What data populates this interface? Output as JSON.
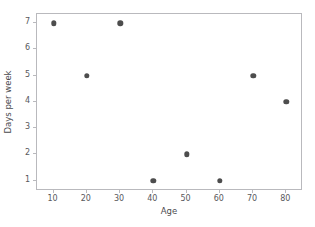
{
  "chart_data": {
    "type": "scatter",
    "title": "",
    "xlabel": "Age",
    "ylabel": "Days per week",
    "xlim": [
      5,
      85
    ],
    "ylim": [
      0.6,
      7.35
    ],
    "grid": false,
    "legend": null,
    "marker_color": "#4d4d4d",
    "frame_color": "#b9b9bd",
    "background_color": "#ffffff",
    "xticks": [
      10,
      20,
      30,
      40,
      50,
      60,
      70,
      80
    ],
    "xtick_labels": [
      "10",
      "20",
      "30",
      "40",
      "50",
      "60",
      "70",
      "80"
    ],
    "yticks": [
      1,
      2,
      3,
      4,
      5,
      6,
      7
    ],
    "ytick_labels": [
      "1",
      "2",
      "3",
      "4",
      "5",
      "6",
      "7"
    ],
    "x": [
      10,
      20,
      30,
      40,
      50,
      60,
      70,
      80
    ],
    "y": [
      7,
      5,
      7,
      1,
      2,
      1,
      5,
      4
    ],
    "points": [
      {
        "x": 10,
        "y": 7
      },
      {
        "x": 20,
        "y": 5
      },
      {
        "x": 30,
        "y": 7
      },
      {
        "x": 40,
        "y": 1
      },
      {
        "x": 50,
        "y": 2
      },
      {
        "x": 60,
        "y": 1
      },
      {
        "x": 70,
        "y": 5
      },
      {
        "x": 80,
        "y": 4
      }
    ]
  }
}
